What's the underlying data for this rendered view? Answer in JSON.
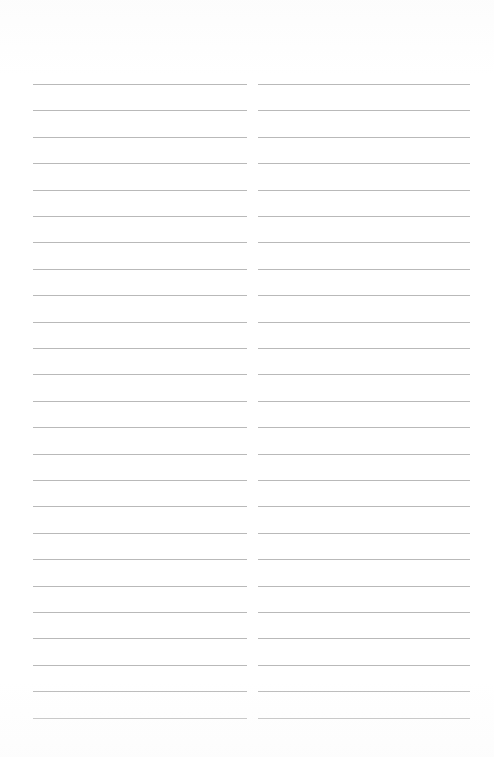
{
  "document": {
    "type": "ruled-notebook-page",
    "page_background": "#ffffff",
    "rule_color": "#b9b9b9",
    "rule_thickness_px": 1,
    "page_width_px": 494,
    "page_height_px": 757,
    "top_margin_px": 84,
    "bottom_last_rule_px": 718,
    "line_spacing_px": 26.4,
    "lines_per_column": 25,
    "columns": [
      {
        "id": "left",
        "name": "left-column",
        "left_px": 33,
        "right_px": 247,
        "width_px": 214,
        "content": ""
      },
      {
        "id": "right",
        "name": "right-column",
        "left_px": 258,
        "right_px": 470,
        "width_px": 212,
        "content": ""
      }
    ],
    "column_gutter_px": 11,
    "text_content": ""
  }
}
